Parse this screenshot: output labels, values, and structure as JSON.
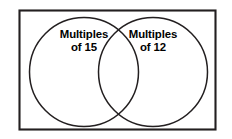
{
  "figure": {
    "type": "venn-diagram",
    "title": "",
    "background_color": "#ffffff",
    "stroke_color": "#231f20",
    "text_color": "#000000"
  },
  "universe": {
    "shape": "rectangle",
    "border_color": "#231f20"
  },
  "sets": [
    {
      "id": "left",
      "label_line_1": "Multiples",
      "label_line_2": "of 15",
      "label_full": "Multiples of 15"
    },
    {
      "id": "right",
      "label_line_1": "Multiples",
      "label_line_2": "of 12",
      "label_full": "Multiples of 12"
    }
  ]
}
